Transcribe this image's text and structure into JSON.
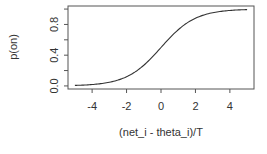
{
  "chart_data": {
    "type": "line",
    "title": "",
    "xlabel": "(net_i - theta_i)/T",
    "ylabel": "p(on)",
    "xlim": [
      -5.4,
      5.4
    ],
    "ylim": [
      -0.04,
      1.04
    ],
    "x_ticks": [
      -4,
      -2,
      0,
      2,
      4
    ],
    "x_tick_labels": [
      "-4",
      "-2",
      "0",
      "2",
      "4"
    ],
    "y_ticks": [
      0.0,
      0.2,
      0.4,
      0.6,
      0.8,
      1.0
    ],
    "y_tick_labels": [
      "0.0",
      "",
      "0.4",
      "",
      "0.8",
      ""
    ],
    "grid": false,
    "legend": "none",
    "series": [
      {
        "name": "p(on)",
        "function": "logistic",
        "x": [
          -5,
          -4.5,
          -4,
          -3.5,
          -3,
          -2.5,
          -2,
          -1.5,
          -1,
          -0.5,
          0,
          0.5,
          1,
          1.5,
          2,
          2.5,
          3,
          3.5,
          4,
          4.5,
          5
        ],
        "y": [
          0.0067,
          0.011,
          0.018,
          0.029,
          0.047,
          0.076,
          0.119,
          0.182,
          0.269,
          0.378,
          0.5,
          0.622,
          0.731,
          0.818,
          0.881,
          0.924,
          0.953,
          0.971,
          0.982,
          0.989,
          0.9933
        ],
        "color": "#333333"
      }
    ]
  }
}
